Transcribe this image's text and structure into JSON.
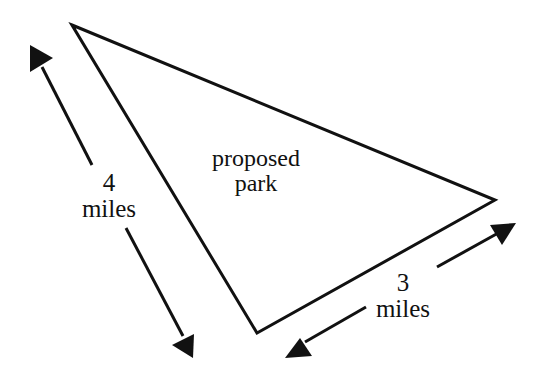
{
  "diagram": {
    "type": "triangle-with-dimension-arrows",
    "region_label_line1": "proposed",
    "region_label_line2": "park",
    "left_side": {
      "value": "4",
      "unit": "miles"
    },
    "bottom_side": {
      "value": "3",
      "unit": "miles"
    },
    "colors": {
      "stroke": "#111111",
      "background": "#ffffff"
    }
  }
}
